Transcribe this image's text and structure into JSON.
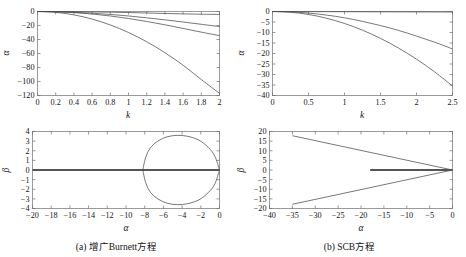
{
  "figure": {
    "caption_a": "(a) 增广Burnett方程",
    "caption_b": "(b) SCB方程"
  },
  "chart_data": [
    {
      "id": "panel-a-top",
      "type": "line",
      "title": "",
      "xlabel": "k",
      "ylabel": "α",
      "xlim": [
        0,
        2
      ],
      "ylim": [
        -120,
        0
      ],
      "xticks": [
        0,
        0.2,
        0.4,
        0.6,
        0.8,
        1,
        1.2,
        1.4,
        1.6,
        1.8,
        2
      ],
      "xticklabels": [
        "0",
        "0.2",
        "0.4",
        "0.6",
        "0.8",
        "1",
        "1.2",
        "1.4",
        "1.6",
        "1.8",
        "2"
      ],
      "yticks": [
        0,
        -20,
        -40,
        -60,
        -80,
        -100,
        -120
      ],
      "yticklabels": [
        "0",
        "−20",
        "−40",
        "−60",
        "−80",
        "−100",
        "−120"
      ],
      "grid": false,
      "legend": "none",
      "series": [
        {
          "name": "mode-1",
          "x": [
            0,
            0.2,
            0.4,
            0.6,
            0.8,
            1.0,
            1.2,
            1.4,
            1.6,
            1.8,
            2.0
          ],
          "values": [
            0,
            -0.1,
            -0.3,
            -0.6,
            -1.0,
            -1.5,
            -2.1,
            -2.8,
            -3.4,
            -3.9,
            -4.2
          ]
        },
        {
          "name": "mode-2",
          "x": [
            0,
            0.2,
            0.4,
            0.6,
            0.8,
            1.0,
            1.2,
            1.4,
            1.6,
            1.8,
            2.0
          ],
          "values": [
            0,
            -0.3,
            -1.1,
            -2.4,
            -4.2,
            -6.4,
            -9.0,
            -11.9,
            -15.0,
            -18.3,
            -21.5
          ]
        },
        {
          "name": "mode-3",
          "x": [
            0,
            0.2,
            0.4,
            0.6,
            0.8,
            1.0,
            1.2,
            1.4,
            1.6,
            1.8,
            2.0
          ],
          "values": [
            0,
            -0.4,
            -1.6,
            -3.6,
            -6.4,
            -10.0,
            -14.2,
            -19.0,
            -24.2,
            -29.5,
            -34.5
          ]
        },
        {
          "name": "mode-4",
          "x": [
            0,
            0.2,
            0.4,
            0.6,
            0.8,
            1.0,
            1.2,
            1.4,
            1.6,
            1.8,
            2.0
          ],
          "values": [
            0,
            -1.2,
            -4.8,
            -10.8,
            -19.2,
            -30.0,
            -43.2,
            -58.8,
            -76.8,
            -97.2,
            -117.0
          ]
        }
      ]
    },
    {
      "id": "panel-b-top",
      "type": "line",
      "title": "",
      "xlabel": "k",
      "ylabel": "α",
      "xlim": [
        0,
        2.5
      ],
      "ylim": [
        -40,
        0
      ],
      "xticks": [
        0,
        0.5,
        1,
        1.5,
        2,
        2.5
      ],
      "xticklabels": [
        "0",
        "0.5",
        "1",
        "1.5",
        "2",
        "2.5"
      ],
      "yticks": [
        0,
        -5,
        -10,
        -15,
        -20,
        -25,
        -30,
        -35,
        -40
      ],
      "yticklabels": [
        "0",
        "−5",
        "−10",
        "−15",
        "−20",
        "−25",
        "−30",
        "−35",
        "−40"
      ],
      "grid": false,
      "legend": "none",
      "series": [
        {
          "name": "mode-1",
          "x": [
            0,
            0.5,
            1.0,
            1.5,
            2.0,
            2.5
          ],
          "values": [
            0,
            -0.05,
            -0.1,
            -0.15,
            -0.2,
            -0.25
          ]
        },
        {
          "name": "mode-2",
          "x": [
            0,
            0.25,
            0.5,
            0.75,
            1.0,
            1.25,
            1.5,
            1.75,
            2.0,
            2.25,
            2.5
          ],
          "values": [
            0,
            -0.2,
            -0.75,
            -1.7,
            -3.0,
            -4.7,
            -6.7,
            -9.0,
            -11.7,
            -14.6,
            -17.8
          ]
        },
        {
          "name": "mode-3",
          "x": [
            0,
            0.25,
            0.5,
            0.75,
            1.0,
            1.25,
            1.5,
            1.75,
            2.0,
            2.25,
            2.5
          ],
          "values": [
            0,
            -0.35,
            -1.4,
            -3.2,
            -5.7,
            -8.9,
            -12.8,
            -17.4,
            -22.7,
            -28.7,
            -35.5
          ]
        }
      ]
    },
    {
      "id": "panel-a-bottom",
      "type": "line",
      "title": "",
      "xlabel": "α",
      "ylabel": "β",
      "xlim": [
        -20,
        0
      ],
      "ylim": [
        -4,
        4
      ],
      "xticks": [
        -20,
        -18,
        -16,
        -14,
        -12,
        -10,
        -8,
        -6,
        -4,
        -2,
        0
      ],
      "xticklabels": [
        "−20",
        "−18",
        "−16",
        "−14",
        "−12",
        "−10",
        "−8",
        "−6",
        "−4",
        "−2",
        "0"
      ],
      "yticks": [
        4,
        3,
        2,
        1,
        0,
        -1,
        -2,
        -3,
        -4
      ],
      "yticklabels": [
        "4",
        "3",
        "2",
        "1",
        "0",
        "−1",
        "−2",
        "−3",
        "−4"
      ],
      "grid": false,
      "legend": "none",
      "series": [
        {
          "name": "real-axis-branch",
          "type": "segment",
          "x": [
            -20,
            0
          ],
          "values": [
            0,
            0
          ]
        },
        {
          "name": "closed-loop-upper",
          "x": [
            0,
            -0.5,
            -1.2,
            -2.2,
            -3.4,
            -4.5,
            -5.6,
            -6.6,
            -7.4,
            -7.9,
            -8.2
          ],
          "values": [
            0,
            1.45,
            2.35,
            3.1,
            3.5,
            3.6,
            3.45,
            3.0,
            2.3,
            1.3,
            0
          ]
        },
        {
          "name": "closed-loop-lower",
          "x": [
            0,
            -0.5,
            -1.2,
            -2.2,
            -3.4,
            -4.5,
            -5.6,
            -6.6,
            -7.4,
            -7.9,
            -8.2
          ],
          "values": [
            0,
            -1.45,
            -2.35,
            -3.1,
            -3.5,
            -3.6,
            -3.45,
            -3.0,
            -2.3,
            -1.3,
            0
          ]
        }
      ]
    },
    {
      "id": "panel-b-bottom",
      "type": "line",
      "title": "",
      "xlabel": "α",
      "ylabel": "β",
      "xlim": [
        -40,
        0
      ],
      "ylim": [
        -20,
        20
      ],
      "xticks": [
        -40,
        -35,
        -30,
        -25,
        -20,
        -15,
        -10,
        -5,
        0
      ],
      "xticklabels": [
        "−40",
        "−35",
        "−30",
        "−25",
        "−20",
        "−15",
        "−10",
        "−5",
        "0"
      ],
      "yticks": [
        20,
        15,
        10,
        5,
        0,
        -5,
        -10,
        -15,
        -20
      ],
      "yticklabels": [
        "20",
        "15",
        "10",
        "5",
        "0",
        "−5",
        "−10",
        "−15",
        "−20"
      ],
      "grid": false,
      "legend": "none",
      "series": [
        {
          "name": "upper-branch",
          "x": [
            0,
            -35
          ],
          "values": [
            0,
            17.8
          ]
        },
        {
          "name": "lower-branch",
          "x": [
            0,
            -35
          ],
          "values": [
            0,
            -17.8
          ]
        },
        {
          "name": "real-axis-branch",
          "type": "segment",
          "x": [
            -18,
            0
          ],
          "values": [
            0,
            0
          ]
        }
      ]
    }
  ]
}
